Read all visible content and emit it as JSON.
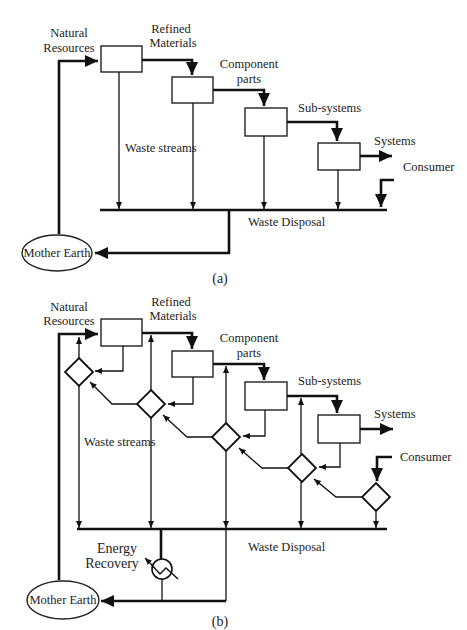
{
  "diagram_a": {
    "caption": "(a)",
    "labels": {
      "natural_resources": [
        "Natural",
        "Resources"
      ],
      "refined_materials": [
        "Refined",
        "Materials"
      ],
      "component_parts": [
        "Component",
        "parts"
      ],
      "sub_systems": "Sub-systems",
      "systems": "Systems",
      "consumer": "Consumer",
      "waste_streams": "Waste streams",
      "waste_disposal": "Waste Disposal",
      "mother_earth": "Mother Earth"
    }
  },
  "diagram_b": {
    "caption": "(b)",
    "labels": {
      "natural_resources": [
        "Natural",
        "Resources"
      ],
      "refined_materials": [
        "Refined",
        "Materials"
      ],
      "component_parts": [
        "Component",
        "parts"
      ],
      "sub_systems": "Sub-systems",
      "systems": "Systems",
      "consumer": "Consumer",
      "waste_streams": "Waste streams",
      "waste_disposal": "Waste Disposal",
      "energy_recovery": [
        "Energy",
        "Recovery"
      ],
      "mother_earth": "Mother Earth"
    }
  }
}
